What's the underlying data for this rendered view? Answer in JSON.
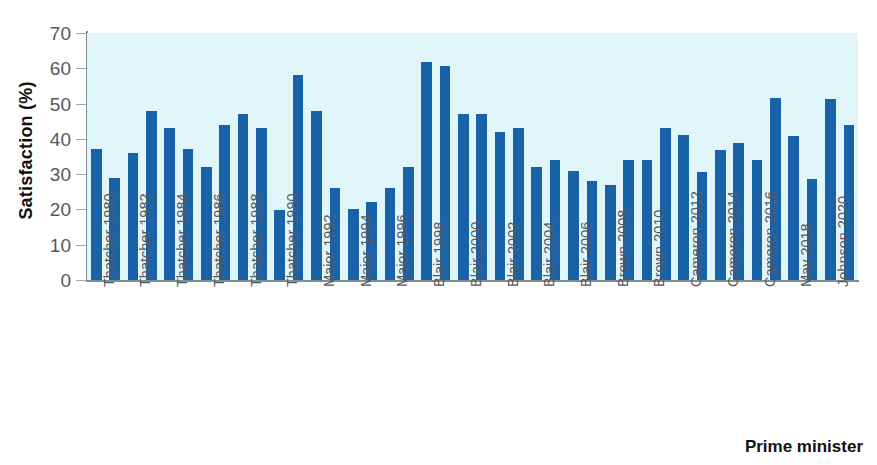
{
  "chart_data": {
    "type": "bar",
    "title": "",
    "xlabel": "Prime minister",
    "ylabel": "Satisfaction (%)",
    "ylim": [
      0,
      70
    ],
    "yticks": [
      0,
      10,
      20,
      30,
      40,
      50,
      60,
      70
    ],
    "grid": false,
    "legend": null,
    "bar_color": "#1a62a8",
    "plot_background": "#e1f6fb",
    "categories": [
      "Thatcher 1980",
      "Thatcher 1981",
      "Thatcher 1982",
      "Thatcher 1983",
      "Thatcher 1984",
      "Thatcher 1985",
      "Thatcher 1986",
      "Thatcher 1987",
      "Thatcher 1988",
      "Thatcher 1989",
      "Thatcher 1990",
      "Major 1991",
      "Major 1992",
      "Major 1993",
      "Major 1994",
      "Major 1995",
      "Major 1996",
      "Blair 1997",
      "Blair 1998",
      "Blair 1999",
      "Blair 2000",
      "Blair 2001",
      "Blair 2002",
      "Blair 2003",
      "Blair 2004",
      "Blair 2005",
      "Blair 2006",
      "Brown 2007",
      "Brown 2008",
      "Brown 2009",
      "Brown 2010",
      "Cameron 2011",
      "Cameron 2012",
      "Cameron 2013",
      "Cameron 2014",
      "Cameron 2015",
      "Cameron 2016",
      "May 2017",
      "May 2018",
      "May 2019",
      "Johnson 2020",
      "Johnson 2021"
    ],
    "values": [
      37.0,
      29.0,
      36.0,
      48.0,
      43.0,
      37.0,
      32.0,
      44.0,
      47.0,
      43.0,
      19.8,
      58.0,
      48.0,
      26.0,
      20.0,
      22.0,
      26.0,
      32.0,
      61.8,
      60.6,
      47.0,
      47.0,
      42.0,
      43.0,
      32.0,
      34.0,
      30.8,
      28.0,
      27.0,
      34.0,
      34.0,
      43.0,
      41.0,
      30.7,
      36.8,
      38.7,
      34.0,
      51.5,
      40.7,
      28.7,
      51.2,
      44.0
    ],
    "tick_label_indices": [
      0,
      2,
      4,
      6,
      8,
      10,
      12,
      14,
      16,
      18,
      20,
      22,
      24,
      26,
      28,
      30,
      32,
      34,
      36,
      38,
      40
    ],
    "tick_labels": [
      "Thatcher 1980",
      "Thatcher 1982",
      "Thatcher 1984",
      "Thatcher 1986",
      "Thatcher 1988",
      "Thatcher 1990",
      "Major 1992",
      "Major 1994",
      "Major 1996",
      "Blair 1998",
      "Blair 2000",
      "Blair 2002",
      "Blair 2004",
      "Blair 2006",
      "Brown 2008",
      "Brown 2010",
      "Cameron 2012",
      "Cameron 2014",
      "Cameron 2016",
      "May 2018",
      "Johnson 2020"
    ]
  },
  "axes": {
    "y_title": "Satisfaction (%)",
    "x_title": "Prime minister"
  }
}
